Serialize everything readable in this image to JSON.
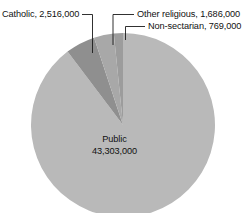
{
  "chart_data": {
    "type": "pie",
    "title": "",
    "subtitle": "",
    "xlabel": "",
    "ylabel": "",
    "legend_position": "none",
    "grid": false,
    "units": "students",
    "total": 48274000,
    "categories": [
      "Public",
      "Catholic",
      "Other religious",
      "Non-sectarian"
    ],
    "values": [
      43303000,
      2516000,
      1686000,
      769000
    ],
    "labels_formatted": [
      "43,303,000",
      "2,516,000",
      "1,686,000",
      "769,000"
    ],
    "percentages": [
      89.7,
      5.2,
      3.5,
      1.6
    ],
    "slices": [
      {
        "name": "Public",
        "value": 43303000,
        "value_text": "43,303,000",
        "percent": 89.7,
        "angle_deg": 322.9,
        "color": "#b9b9b9",
        "label_placement": "inside"
      },
      {
        "name": "Catholic",
        "value": 2516000,
        "value_text": "2,516,000",
        "percent": 5.2,
        "angle_deg": 18.8,
        "color": "#8f8f8f",
        "label_placement": "outside-left"
      },
      {
        "name": "Other religious",
        "value": 1686000,
        "value_text": "1,686,000",
        "percent": 3.5,
        "angle_deg": 12.6,
        "color": "#a8a8a8",
        "label_placement": "outside-right"
      },
      {
        "name": "Non-sectarian",
        "value": 769000,
        "value_text": "769,000",
        "percent": 1.6,
        "angle_deg": 5.7,
        "color": "#9c9c9c",
        "label_placement": "outside-right"
      }
    ]
  },
  "labels": {
    "catholic": "Catholic, 2,516,000",
    "other_religious": "Other religious, 1,686,000",
    "non_sectarian": "Non-sectarian, 769,000",
    "public_name": "Public",
    "public_value": "43,303,000"
  },
  "colors": {
    "background": "#ffffff",
    "text": "#111111",
    "leader_line": "#1a1a1a",
    "slice_public": "#b9b9b9",
    "slice_catholic": "#8f8f8f",
    "slice_other_religious": "#a8a8a8",
    "slice_non_sectarian": "#9c9c9c"
  }
}
